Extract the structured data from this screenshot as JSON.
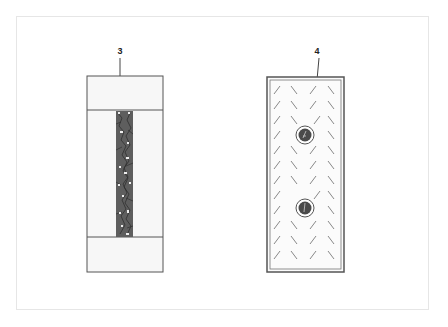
{
  "figure": {
    "items": [
      {
        "id": "3",
        "label": "3",
        "description": "Rectangular panel with top and bottom bands and a dark textured central strip"
      },
      {
        "id": "4",
        "label": "4",
        "description": "Double-bordered rectangular panel with herringbone hatch pattern and two circular fasteners"
      }
    ]
  },
  "colors": {
    "outline": "#555555",
    "fill_light": "#f7f7f7",
    "strip_dark": "#5a5a5a",
    "hatch": "#7a7a7a",
    "frame_border": "#e6e6e6"
  }
}
